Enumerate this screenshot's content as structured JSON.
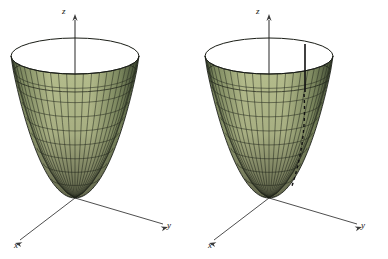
{
  "figure": {
    "type": "3d-surface-plot-pair",
    "background_color": "#ffffff",
    "width": 388,
    "height": 259
  },
  "colors": {
    "interior_fill": "#93a6ba",
    "interior_fill_dark": "#7d91a7",
    "exterior_fill": "#b7bf8e",
    "exterior_fill_dark": "#7e8a60",
    "exterior_fill_darkest": "#3f4a33",
    "mesh_line": "#2a2f22",
    "interior_mesh_line": "#2b3340",
    "rim_line": "#1a1d16",
    "axis_line": "#3a3a3a",
    "highlight_line": "#111111",
    "dashed_line": "#111111",
    "label_color": "#111111"
  },
  "panels": [
    {
      "id": "left",
      "name": "paraboloid-plain",
      "axes": {
        "z": {
          "label": "z",
          "label_x": 62,
          "label_y": 14
        },
        "y": {
          "label": "y",
          "label_x": 167,
          "label_y": 228
        },
        "x": {
          "label": "x",
          "label_x": 14,
          "label_y": 248
        }
      },
      "origin": {
        "x": 75,
        "y": 198
      },
      "surface": {
        "rim_center_x": 75,
        "rim_center_y": 56,
        "rim_radius_x": 64,
        "rim_radius_y": 18,
        "vertex_y": 198,
        "band_split_y": 86,
        "meridian_count": 24,
        "ring_count": 9
      },
      "annotations": []
    },
    {
      "id": "right",
      "name": "paraboloid-annotated",
      "axes": {
        "z": {
          "label": "z",
          "label_x": 256,
          "label_y": 14
        },
        "y": {
          "label": "y",
          "label_x": 361,
          "label_y": 228
        },
        "x": {
          "label": "x",
          "label_x": 208,
          "label_y": 248
        }
      },
      "origin": {
        "x": 269,
        "y": 198
      },
      "surface": {
        "rim_center_x": 269,
        "rim_center_y": 56,
        "rim_radius_x": 64,
        "rim_radius_y": 18,
        "vertex_y": 198,
        "band_split_y": 86,
        "meridian_count": 24,
        "ring_count": 9
      },
      "annotations": [
        {
          "kind": "solid-vertical-line",
          "name": "highlight-meridian",
          "x": 305,
          "y_top": 44,
          "y_bottom": 92,
          "width": 1.6
        },
        {
          "kind": "dashed-curve",
          "name": "dashed-trace-curve",
          "x_top": 304,
          "y_top": 94,
          "x_bottom": 292,
          "y_bottom": 186,
          "dash": "3 3",
          "width": 1.4
        }
      ]
    }
  ],
  "chart_data": {
    "type": "scatter",
    "title": "",
    "subtitle": "",
    "xlabel": "x",
    "ylabel": "y",
    "zlabel": "z",
    "surface_equation": "z = x^2 + y^2",
    "projection": "oblique-3d",
    "grid": true,
    "legend": false,
    "series": [
      {
        "name": "circular paraboloid (left panel)",
        "surface": "z = x^2 + y^2",
        "mesh": {
          "meridians": 24,
          "rings": 9
        },
        "interior_visible": true
      },
      {
        "name": "circular paraboloid (right panel)",
        "surface": "z = x^2 + y^2",
        "mesh": {
          "meridians": 24,
          "rings": 9
        },
        "interior_visible": true,
        "overlays": [
          "solid vertical line on back inner wall",
          "dashed curve down the front surface"
        ]
      }
    ],
    "axis_labels": [
      "x",
      "y",
      "z"
    ],
    "tick_labels": [],
    "annotations": [
      "z",
      "y",
      "x",
      "z",
      "y",
      "x"
    ]
  }
}
